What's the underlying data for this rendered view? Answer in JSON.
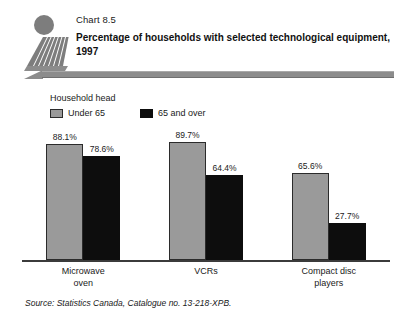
{
  "header": {
    "chart_number": "Chart 8.5",
    "title": "Percentage of households with selected technological equipment, 1997",
    "logo_name": "statistics-canada-logo"
  },
  "legend": {
    "title": "Household head",
    "items": [
      {
        "label": "Under 65",
        "color": "#9a9a9a"
      },
      {
        "label": "65 and over",
        "color": "#0d0d0d"
      }
    ]
  },
  "source": "Source:  Statistics Canada, Catalogue no. 13-218-XPB.",
  "chart_data": {
    "type": "bar",
    "title": "Percentage of households with selected technological equipment, 1997",
    "xlabel": "",
    "ylabel": "",
    "ylim": [
      0,
      100
    ],
    "grid": false,
    "legend_position": "top-left",
    "legend_title": "Household head",
    "categories": [
      "Microwave oven",
      "VCRs",
      "Compact disc players"
    ],
    "category_lines": [
      [
        "Microwave",
        "oven"
      ],
      [
        "VCRs"
      ],
      [
        "Compact disc",
        "players"
      ]
    ],
    "series": [
      {
        "name": "Under 65",
        "color": "#9a9a9a",
        "values": [
          88.1,
          89.7,
          65.6
        ],
        "labels": [
          "88.1%",
          "89.7%",
          "65.6%"
        ]
      },
      {
        "name": "65 and over",
        "color": "#0d0d0d",
        "values": [
          78.6,
          64.4,
          27.7
        ],
        "labels": [
          "78.6%",
          "64.4%",
          "27.7%"
        ]
      }
    ]
  }
}
